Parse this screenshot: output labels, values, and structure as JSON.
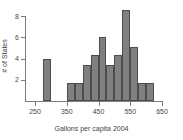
{
  "chart_data": {
    "type": "bar",
    "title": "",
    "subtitle": "",
    "xlabel": "Gallons per capita 2004",
    "ylabel": "# of States",
    "xlim": [
      230,
      660
    ],
    "ylim": [
      0,
      8.8
    ],
    "grid": false,
    "legend": null,
    "bin_width": 25,
    "xticks": [
      250,
      350,
      450,
      550,
      650
    ],
    "yticks": [
      2,
      4,
      6,
      8
    ],
    "bars": [
      {
        "bin_start": 275,
        "bin_end": 300,
        "value": 4
      },
      {
        "bin_start": 350,
        "bin_end": 375,
        "value": 1.7
      },
      {
        "bin_start": 375,
        "bin_end": 400,
        "value": 1.7
      },
      {
        "bin_start": 400,
        "bin_end": 425,
        "value": 3.4
      },
      {
        "bin_start": 425,
        "bin_end": 450,
        "value": 4.3
      },
      {
        "bin_start": 450,
        "bin_end": 475,
        "value": 6
      },
      {
        "bin_start": 475,
        "bin_end": 500,
        "value": 3.4
      },
      {
        "bin_start": 500,
        "bin_end": 525,
        "value": 4.3
      },
      {
        "bin_start": 525,
        "bin_end": 550,
        "value": 8.6
      },
      {
        "bin_start": 550,
        "bin_end": 575,
        "value": 5.1
      },
      {
        "bin_start": 575,
        "bin_end": 600,
        "value": 1.7
      },
      {
        "bin_start": 600,
        "bin_end": 625,
        "value": 1.7
      }
    ],
    "categories": [
      "275-300",
      "350-375",
      "375-400",
      "400-425",
      "425-450",
      "450-475",
      "475-500",
      "500-525",
      "525-550",
      "550-575",
      "575-600",
      "600-625"
    ],
    "values": [
      4,
      1.7,
      1.7,
      3.4,
      4.3,
      6,
      3.4,
      4.3,
      8.6,
      5.1,
      1.7,
      1.7
    ],
    "colors": {
      "bar_fill": "#808080",
      "bar_stroke": "#4d4d4d",
      "axis": "#7d7d7d",
      "text": "#3f3f3f",
      "background": "#ffffff"
    }
  }
}
